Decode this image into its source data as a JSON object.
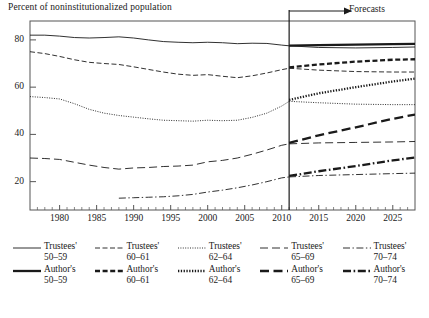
{
  "chart_data": {
    "type": "line",
    "title": "",
    "ylabel": "Percent of noninstitutionalized population",
    "xlabel": "",
    "xlim": [
      1976,
      2028
    ],
    "ylim": [
      8,
      88
    ],
    "yticks": [
      20,
      40,
      60,
      80
    ],
    "xticks": [
      1980,
      1985,
      1990,
      1995,
      2000,
      2005,
      2010,
      2015,
      2020,
      2025
    ],
    "xminor_step": 1,
    "grid": false,
    "legend_position": "below",
    "annotations": [
      {
        "text": "Forecasts",
        "x": 2011,
        "type": "vertical-divider-with-arrow"
      }
    ],
    "forecast_start": 2011,
    "series": [
      {
        "name": "Trustees' 50–59",
        "style": "thin-solid",
        "x": [
          1976,
          1978,
          1980,
          1982,
          1984,
          1986,
          1988,
          1990,
          1992,
          1994,
          1996,
          1998,
          2000,
          2002,
          2004,
          2006,
          2008,
          2010,
          2011
        ],
        "values": [
          82,
          82,
          81.6,
          81,
          80.8,
          81,
          81.3,
          80.8,
          80,
          79.3,
          79,
          78.8,
          79,
          78.8,
          78.4,
          78.6,
          78.5,
          77.8,
          77.5
        ]
      },
      {
        "name": "Trustees' 60–61",
        "style": "thin-dashed",
        "x": [
          1976,
          1978,
          1980,
          1982,
          1984,
          1986,
          1988,
          1990,
          1992,
          1994,
          1996,
          1998,
          2000,
          2002,
          2004,
          2006,
          2008,
          2010,
          2011
        ],
        "values": [
          75,
          74.2,
          73,
          71.6,
          70.5,
          70,
          69.6,
          68.6,
          67.5,
          66.4,
          65.5,
          65,
          65.3,
          64.6,
          64,
          64.8,
          66,
          67.4,
          68
        ]
      },
      {
        "name": "Trustees' 62–64",
        "style": "thin-dotted",
        "x": [
          1976,
          1978,
          1980,
          1982,
          1984,
          1986,
          1988,
          1990,
          1992,
          1994,
          1996,
          1998,
          2000,
          2002,
          2004,
          2006,
          2008,
          2010,
          2011
        ],
        "values": [
          56,
          55.6,
          55,
          53,
          50.6,
          49,
          48,
          47.3,
          46.6,
          46,
          45.8,
          45.6,
          46,
          45.8,
          46,
          47.2,
          49,
          52,
          54
        ]
      },
      {
        "name": "Trustees' 65–69",
        "style": "thin-longdash",
        "x": [
          1976,
          1978,
          1980,
          1982,
          1984,
          1986,
          1988,
          1990,
          1992,
          1994,
          1996,
          1998,
          2000,
          2002,
          2004,
          2006,
          2008,
          2010,
          2011
        ],
        "values": [
          30,
          29.8,
          29.4,
          28.2,
          27,
          26,
          25.3,
          25.8,
          26,
          26.4,
          26.6,
          27,
          28.4,
          29,
          30,
          31.6,
          33.4,
          35.4,
          36
        ]
      },
      {
        "name": "Trustees' 70–74",
        "style": "thin-dashdot",
        "x": [
          1988,
          1990,
          1992,
          1994,
          1996,
          1998,
          2000,
          2002,
          2004,
          2006,
          2008,
          2010,
          2011
        ],
        "values": [
          13,
          13.2,
          13.4,
          13.6,
          14,
          14.6,
          15.6,
          16.4,
          17.4,
          18.6,
          20,
          21.6,
          22
        ]
      },
      {
        "name": "Author's 50–59",
        "style": "bold-solid",
        "x": [
          2011,
          2015,
          2020,
          2025,
          2028
        ],
        "values": [
          77.6,
          77.8,
          78,
          78.2,
          78.3
        ]
      },
      {
        "name": "Author's 60–61",
        "style": "bold-dashed",
        "x": [
          2011,
          2015,
          2020,
          2025,
          2028
        ],
        "values": [
          68.4,
          69.6,
          70.8,
          71.6,
          71.8
        ]
      },
      {
        "name": "Author's 62–64",
        "style": "bold-dotted",
        "x": [
          2011,
          2015,
          2020,
          2025,
          2028
        ],
        "values": [
          54.6,
          57.4,
          60,
          62.4,
          63.6
        ]
      },
      {
        "name": "Author's 65–69",
        "style": "bold-longdash",
        "x": [
          2011,
          2015,
          2020,
          2025,
          2028
        ],
        "values": [
          36.4,
          39.6,
          43,
          46.6,
          48.4
        ]
      },
      {
        "name": "Author's 70–74",
        "style": "bold-dashdot",
        "x": [
          2011,
          2015,
          2020,
          2025,
          2028
        ],
        "values": [
          22.4,
          24.4,
          26.6,
          29,
          30.2
        ]
      },
      {
        "name": "Trustees' 50–59 forecast",
        "style": "thin-solid",
        "x": [
          2011,
          2015,
          2020,
          2025,
          2028
        ],
        "values": [
          77.5,
          76.8,
          76.6,
          76.8,
          77
        ]
      },
      {
        "name": "Trustees' 60–61 forecast",
        "style": "thin-dashed",
        "x": [
          2011,
          2015,
          2020,
          2025,
          2028
        ],
        "values": [
          68,
          67.2,
          66.6,
          66.4,
          66.4
        ]
      },
      {
        "name": "Trustees' 62–64 forecast",
        "style": "thin-dotted",
        "x": [
          2011,
          2015,
          2020,
          2025,
          2028
        ],
        "values": [
          54,
          53.4,
          52.8,
          52.6,
          52.6
        ]
      },
      {
        "name": "Trustees' 65–69 forecast",
        "style": "thin-longdash",
        "x": [
          2011,
          2015,
          2020,
          2025,
          2028
        ],
        "values": [
          36,
          36.4,
          36.6,
          36.8,
          37
        ]
      },
      {
        "name": "Trustees' 70–74 forecast",
        "style": "thin-dashdot",
        "x": [
          2011,
          2015,
          2020,
          2025,
          2028
        ],
        "values": [
          22,
          22.6,
          23,
          23.4,
          23.6
        ]
      }
    ]
  },
  "axis_title": "Percent of noninstitutionalized population",
  "forecast_label": "Forecasts",
  "ytick_labels": [
    "80",
    "60",
    "40",
    "20"
  ],
  "xtick_labels": [
    "1980",
    "1985",
    "1990",
    "1995",
    "2000",
    "2005",
    "2010",
    "2015",
    "2020",
    "2025"
  ],
  "legend": {
    "row1": [
      {
        "label_line1": "Trustees'",
        "label_line2": "50–59",
        "style": "thin-solid"
      },
      {
        "label_line1": "Trustees'",
        "label_line2": "60–61",
        "style": "thin-dashed"
      },
      {
        "label_line1": "Trustees'",
        "label_line2": "62–64",
        "style": "thin-dotted"
      },
      {
        "label_line1": "Trustees'",
        "label_line2": "65–69",
        "style": "thin-longdash"
      },
      {
        "label_line1": "Trustees'",
        "label_line2": "70–74",
        "style": "thin-dashdot"
      }
    ],
    "row2": [
      {
        "label_line1": "Author's",
        "label_line2": "50–59",
        "style": "bold-solid"
      },
      {
        "label_line1": "Author's",
        "label_line2": "60–61",
        "style": "bold-dashed"
      },
      {
        "label_line1": "Author's",
        "label_line2": "62–64",
        "style": "bold-dotted"
      },
      {
        "label_line1": "Author's",
        "label_line2": "65–69",
        "style": "bold-longdash"
      },
      {
        "label_line1": "Author's",
        "label_line2": "70–74",
        "style": "bold-dashdot"
      }
    ]
  },
  "colors": {
    "ink": "#1a1a1a",
    "frame": "#555555"
  }
}
